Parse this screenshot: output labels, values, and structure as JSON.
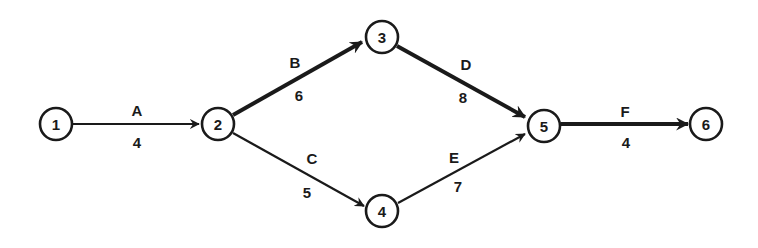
{
  "diagram": {
    "type": "activity-on-arrow network",
    "colors": {
      "stroke": "#1a1a1a",
      "background": "#ffffff"
    },
    "nodes": [
      {
        "id": "1",
        "label": "1",
        "x": 56,
        "y": 124
      },
      {
        "id": "2",
        "label": "2",
        "x": 218,
        "y": 124
      },
      {
        "id": "3",
        "label": "3",
        "x": 382,
        "y": 37
      },
      {
        "id": "4",
        "label": "4",
        "x": 382,
        "y": 211
      },
      {
        "id": "5",
        "label": "5",
        "x": 544,
        "y": 126
      },
      {
        "id": "6",
        "label": "6",
        "x": 706,
        "y": 124
      }
    ],
    "edges": [
      {
        "activity": "A",
        "duration": "4",
        "from": "1",
        "to": "2",
        "critical": false
      },
      {
        "activity": "B",
        "duration": "6",
        "from": "2",
        "to": "3",
        "critical": true
      },
      {
        "activity": "C",
        "duration": "5",
        "from": "2",
        "to": "4",
        "critical": false
      },
      {
        "activity": "D",
        "duration": "8",
        "from": "3",
        "to": "5",
        "critical": true
      },
      {
        "activity": "E",
        "duration": "7",
        "from": "4",
        "to": "5",
        "critical": false
      },
      {
        "activity": "F",
        "duration": "4",
        "from": "5",
        "to": "6",
        "critical": true
      }
    ]
  }
}
